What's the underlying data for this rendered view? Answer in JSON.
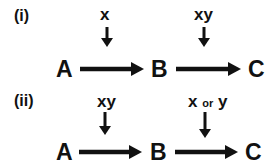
{
  "panels": [
    {
      "label": "(i)",
      "nodes": [
        "A",
        "B",
        "C"
      ],
      "regulators": [
        {
          "text": "x",
          "target": "A→B"
        },
        {
          "text": "xy",
          "target": "B→C"
        }
      ]
    },
    {
      "label": "(ii)",
      "nodes": [
        "A",
        "B",
        "C"
      ],
      "regulators": [
        {
          "text": "xy",
          "target": "A→B"
        },
        {
          "parts": [
            "x",
            "or",
            "y"
          ],
          "target": "B→C"
        }
      ]
    }
  ]
}
